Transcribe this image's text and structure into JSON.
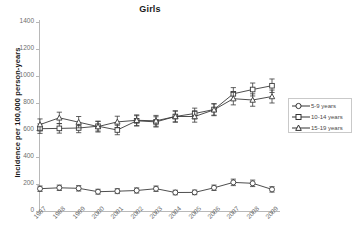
{
  "chart_data": {
    "type": "line",
    "title": "Girls",
    "xlabel": "",
    "ylabel": "Incidence per 100,000 person-years",
    "categories": [
      "1997",
      "1998",
      "1999",
      "2000",
      "2001",
      "2002",
      "2003",
      "2004",
      "2005",
      "2006",
      "2007",
      "2008",
      "2009"
    ],
    "x": [
      1997,
      1998,
      1999,
      2000,
      2001,
      2002,
      2003,
      2004,
      2005,
      2006,
      2007,
      2008,
      2009
    ],
    "ylim": [
      0,
      1400
    ],
    "yticks": [
      0,
      200,
      400,
      600,
      800,
      1000,
      1200,
      1400
    ],
    "grid": false,
    "legend_position": "right",
    "error_bars": true,
    "series": [
      {
        "name": "5-9 years",
        "marker": "circle",
        "values": [
          165,
          172,
          168,
          143,
          147,
          152,
          165,
          137,
          138,
          172,
          212,
          205,
          160
        ],
        "err_low": [
          145,
          152,
          148,
          125,
          129,
          133,
          145,
          120,
          121,
          152,
          188,
          181,
          140
        ],
        "err_high": [
          185,
          192,
          188,
          161,
          165,
          171,
          185,
          154,
          155,
          192,
          236,
          229,
          180
        ]
      },
      {
        "name": "10-14 years",
        "marker": "square",
        "values": [
          610,
          612,
          615,
          628,
          600,
          668,
          660,
          700,
          722,
          752,
          868,
          900,
          928
        ],
        "err_low": [
          575,
          577,
          580,
          592,
          565,
          630,
          622,
          660,
          682,
          710,
          822,
          852,
          878
        ],
        "err_high": [
          645,
          647,
          650,
          664,
          635,
          706,
          698,
          740,
          762,
          794,
          914,
          948,
          978
        ]
      },
      {
        "name": "15-19 years",
        "marker": "triangle",
        "values": [
          640,
          690,
          658,
          625,
          660,
          672,
          668,
          700,
          700,
          750,
          832,
          822,
          848
        ],
        "err_low": [
          598,
          648,
          616,
          585,
          618,
          632,
          628,
          658,
          658,
          706,
          786,
          776,
          800
        ],
        "err_high": [
          682,
          732,
          700,
          665,
          702,
          712,
          708,
          742,
          742,
          794,
          878,
          868,
          896
        ]
      }
    ]
  },
  "legend": {
    "items": [
      {
        "label": "5-9 years",
        "marker": "circle"
      },
      {
        "label": "10-14 years",
        "marker": "square"
      },
      {
        "label": "15-19 years",
        "marker": "triangle"
      }
    ]
  }
}
